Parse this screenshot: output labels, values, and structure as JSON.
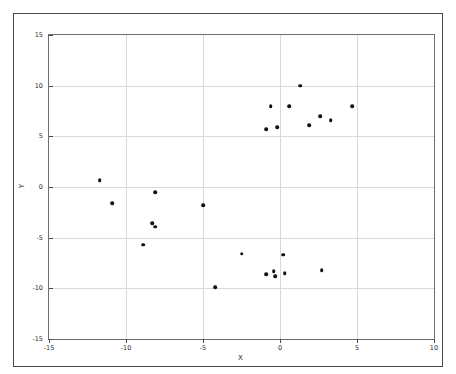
{
  "chart_data": {
    "type": "scatter",
    "title": "",
    "xlabel": "X",
    "ylabel": "Y",
    "xlim": [
      -15,
      10
    ],
    "ylim": [
      -15,
      15
    ],
    "xticks": [
      -15,
      -10,
      -5,
      0,
      5,
      10
    ],
    "yticks": [
      -15,
      -10,
      -5,
      0,
      5,
      10,
      15
    ],
    "xticklabels": [
      "-15",
      "-10",
      "-5",
      "0",
      "5",
      "10"
    ],
    "yticklabels": [
      "-15",
      "-10",
      "-5",
      "0",
      "5",
      "10",
      "15"
    ],
    "grid": true,
    "legend": null,
    "marker": "o",
    "marker_color": "#111111",
    "points": [
      [
        1.3,
        10.0
      ],
      [
        -0.6,
        8.0
      ],
      [
        0.6,
        8.0
      ],
      [
        4.7,
        8.0
      ],
      [
        2.6,
        7.0
      ],
      [
        3.3,
        6.6
      ],
      [
        1.9,
        6.1
      ],
      [
        -0.2,
        5.9
      ],
      [
        -0.9,
        5.7
      ],
      [
        -11.7,
        0.7
      ],
      [
        -8.1,
        -0.5
      ],
      [
        -10.9,
        -1.6
      ],
      [
        -5.0,
        -1.8
      ],
      [
        -8.3,
        -3.6
      ],
      [
        -8.1,
        -3.9
      ],
      [
        -8.9,
        -5.7
      ],
      [
        -2.5,
        -6.6
      ],
      [
        0.2,
        -6.7
      ],
      [
        -0.9,
        -8.6
      ],
      [
        -0.4,
        -8.3
      ],
      [
        -0.3,
        -8.8
      ],
      [
        0.3,
        -8.5
      ],
      [
        2.7,
        -8.2
      ],
      [
        -4.2,
        -9.9
      ]
    ]
  },
  "axes": {
    "x_axis_label": "X",
    "y_axis_label": "Y"
  }
}
